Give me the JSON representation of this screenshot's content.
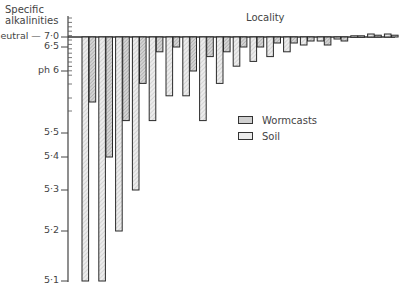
{
  "chart_data": {
    "type": "bar",
    "title": "Locality",
    "ylabel": "Specific alkalinities",
    "xlabel": "",
    "y_ticks": [
      {
        "label": "neutral — 7·0",
        "value": 7.0,
        "y": 37
      },
      {
        "label": "6·5",
        "value": 6.5,
        "y": 47
      },
      {
        "label": "ph 6",
        "value": 6.0,
        "y": 71
      },
      {
        "label": "5·5",
        "value": 5.5,
        "y": 133
      },
      {
        "label": "5·4",
        "value": 5.4,
        "y": 157
      },
      {
        "label": "5·3",
        "value": 5.3,
        "y": 190
      },
      {
        "label": "5·2",
        "value": 5.2,
        "y": 231
      },
      {
        "label": "5·1",
        "value": 5.1,
        "y": 281
      }
    ],
    "ylim": [
      5.1,
      7.6
    ],
    "baseline": 7.0,
    "grid": false,
    "legend_position": "center-right",
    "categories": [
      "1",
      "2",
      "3",
      "4",
      "5",
      "6",
      "7",
      "8",
      "9",
      "10",
      "11",
      "12",
      "13",
      "14",
      "15",
      "16",
      "17",
      "18",
      "19"
    ],
    "series": [
      {
        "name": "Soil",
        "values": [
          5.1,
          5.1,
          5.2,
          5.3,
          5.6,
          5.8,
          5.8,
          5.6,
          5.9,
          6.1,
          6.2,
          6.3,
          6.4,
          6.6,
          6.8,
          6.9,
          7.2,
          7.5,
          7.5
        ]
      },
      {
        "name": "Wormcasts",
        "values": [
          5.75,
          5.4,
          5.6,
          5.9,
          6.4,
          6.5,
          6.0,
          6.3,
          6.4,
          6.5,
          6.5,
          6.7,
          6.7,
          6.8,
          6.6,
          6.8,
          7.2,
          7.3,
          7.3
        ]
      }
    ]
  },
  "legend": {
    "items": [
      {
        "label": "Wormcasts"
      },
      {
        "label": "Soil"
      }
    ]
  },
  "axis": {
    "ylabel_line1": "Specific",
    "ylabel_line2": "alkalinities"
  },
  "colors": {
    "soil_fill": "#e4e4e4",
    "wormcasts_fill": "#c8c8c8",
    "stroke": "#2a2a2a"
  }
}
